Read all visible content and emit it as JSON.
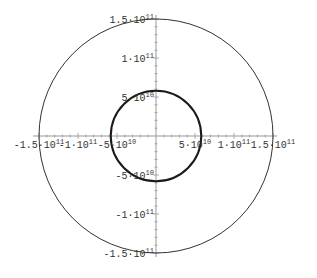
{
  "chart_data": {
    "type": "line",
    "subtype": "parametric-circles",
    "title": "",
    "xlabel": "",
    "ylabel": "",
    "xlim": [
      -150000000000.0,
      150000000000.0
    ],
    "ylim": [
      -150000000000.0,
      150000000000.0
    ],
    "grid": false,
    "legend": null,
    "series": [
      {
        "name": "outer-orbit",
        "shape": "circle",
        "center": [
          0,
          0
        ],
        "radius": 150000000000.0,
        "stroke": "#333333",
        "stroke_width": 1
      },
      {
        "name": "inner-orbit",
        "shape": "circle",
        "center": [
          0,
          0
        ],
        "radius": 58000000000.0,
        "stroke": "#1a1a1a",
        "stroke_width": 2
      }
    ],
    "x_ticks": [
      {
        "value": -150000000000.0,
        "mantissa": "-1.5",
        "exp": "11"
      },
      {
        "value": -100000000000.0,
        "mantissa": "-1",
        "exp": "11"
      },
      {
        "value": -50000000000.0,
        "mantissa": "-5",
        "exp": "10"
      },
      {
        "value": 50000000000.0,
        "mantissa": "5",
        "exp": "10"
      },
      {
        "value": 100000000000.0,
        "mantissa": "1",
        "exp": "11"
      },
      {
        "value": 150000000000.0,
        "mantissa": "1.5",
        "exp": "11"
      }
    ],
    "y_ticks": [
      {
        "value": 150000000000.0,
        "mantissa": "1.5",
        "exp": "11"
      },
      {
        "value": 100000000000.0,
        "mantissa": "1",
        "exp": "11"
      },
      {
        "value": 50000000000.0,
        "mantissa": "5",
        "exp": "10"
      },
      {
        "value": -50000000000.0,
        "mantissa": "-5",
        "exp": "10"
      },
      {
        "value": -100000000000.0,
        "mantissa": "-1",
        "exp": "11"
      },
      {
        "value": -150000000000.0,
        "mantissa": "-1.5",
        "exp": "11"
      }
    ],
    "tick_label_format": "{mantissa}·10^{exp}"
  },
  "layout": {
    "origin_px": [
      156,
      136
    ],
    "px_per_unit": 7.8e-10,
    "axis_color": "#999999"
  }
}
